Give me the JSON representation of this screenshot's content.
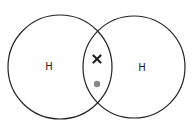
{
  "diagram": {
    "type": "covalent-bond-dot-cross",
    "caption": "",
    "atoms": [
      {
        "symbol": "H",
        "cx": 60,
        "cy": 67,
        "r": 52,
        "label_x": 49,
        "label_y": 67
      },
      {
        "symbol": "H",
        "cx": 134,
        "cy": 67,
        "r": 51,
        "label_x": 142,
        "label_y": 68
      }
    ],
    "shared_electrons": [
      {
        "kind": "cross",
        "cx": 97,
        "cy": 59,
        "color": "#222222"
      },
      {
        "kind": "dot",
        "cx": 97,
        "cy": 84,
        "color": "#888888"
      }
    ],
    "colors": {
      "outline": "#222222",
      "background": "#ffffff"
    }
  }
}
